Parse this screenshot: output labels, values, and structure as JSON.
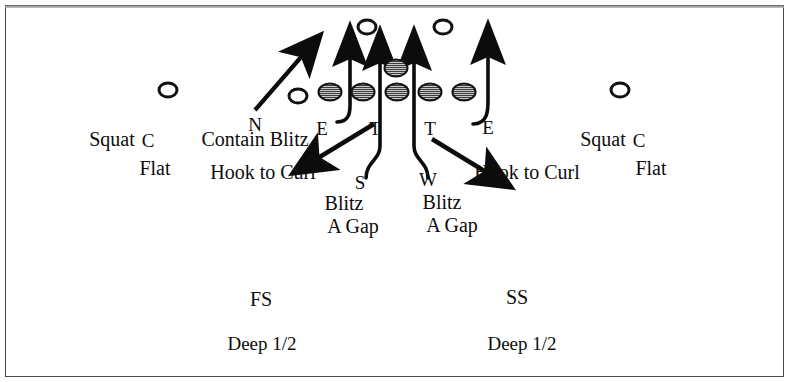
{
  "diagram": {
    "background_color": "#ffffff",
    "ink_color": "#0c0c0c",
    "border_color": "#4a4a4a"
  },
  "positions": {
    "nose": "N",
    "end_left": "E",
    "tackle_left": "T",
    "tackle_right": "T",
    "end_right": "E",
    "sam": "S",
    "will": "W",
    "corner_left": "C",
    "corner_right": "C",
    "free_safety": "FS",
    "strong_safety": "SS"
  },
  "assignments": {
    "squat_left": "Squat",
    "flat_left": "Flat",
    "squat_right": "Squat",
    "flat_right": "Flat",
    "contain_blitz": "Contain Blitz",
    "hook_to_curl_left": "Hook to Curl",
    "hook_to_curl_right": "Hook to Curl",
    "sam_blitz": "Blitz",
    "sam_gap": "A Gap",
    "will_blitz": "Blitz",
    "will_gap": "A Gap",
    "deep_half_left": "Deep 1/2",
    "deep_half_right": "Deep 1/2"
  },
  "markers": {
    "offense_open_circles": [
      {
        "name": "offense-wr-left",
        "x": 168,
        "y": 90
      },
      {
        "name": "offense-te-left",
        "x": 298,
        "y": 96
      },
      {
        "name": "offense-back-left",
        "x": 367,
        "y": 27
      },
      {
        "name": "offense-back-right",
        "x": 443,
        "y": 27
      },
      {
        "name": "offense-wr-right",
        "x": 620,
        "y": 90
      }
    ],
    "defense_filled_circles": [
      {
        "name": "defender-end-left",
        "x": 330,
        "y": 92
      },
      {
        "name": "defender-tackle-left",
        "x": 363,
        "y": 92
      },
      {
        "name": "defender-nose",
        "x": 396,
        "y": 68
      },
      {
        "name": "defender-mid",
        "x": 397,
        "y": 92
      },
      {
        "name": "defender-tackle-right",
        "x": 430,
        "y": 92
      },
      {
        "name": "defender-end-right",
        "x": 464,
        "y": 92
      }
    ]
  },
  "routes": {
    "contain_blitz_arrow": "diagonal up-right",
    "end_left_hook": "curl up",
    "end_right_hook": "curl up",
    "sam_blitz_path": "curve up through A gap",
    "will_blitz_path": "curve up through A gap",
    "hook_to_curl_left_arrow": "diagonal down-left",
    "hook_to_curl_right_arrow": "diagonal down-right"
  }
}
